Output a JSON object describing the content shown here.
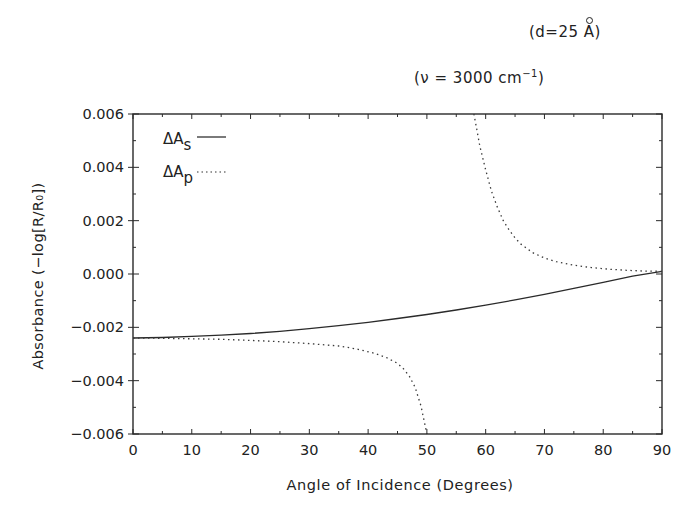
{
  "annotations": {
    "thickness_prefix": "(d=25 ",
    "thickness_unit": "A",
    "thickness_suffix": ")",
    "frequency_prefix": "(ν = 3000 cm",
    "frequency_exp": "−1",
    "frequency_suffix": ")"
  },
  "chart_data": {
    "type": "line",
    "title": "",
    "subtitle": [
      "(d=25 Å)",
      "(ν = 3000 cm⁻¹)"
    ],
    "xlabel": "Angle of Incidence (Degrees)",
    "ylabel": "Absorbance (−log[R/R₀])",
    "xlim": [
      0,
      90
    ],
    "ylim": [
      -0.006,
      0.006
    ],
    "xticks": [
      0,
      10,
      20,
      30,
      40,
      50,
      60,
      70,
      80,
      90
    ],
    "xtick_labels": [
      "0",
      "10",
      "20",
      "30",
      "40",
      "50",
      "60",
      "70",
      "80",
      "90"
    ],
    "yticks": [
      -0.006,
      -0.004,
      -0.002,
      0.0,
      0.002,
      0.004,
      0.006
    ],
    "ytick_labels": [
      "−0.006",
      "−0.004",
      "−0.002",
      "0.000",
      "0.002",
      "0.004",
      "0.006"
    ],
    "grid": false,
    "legend": {
      "position": "upper-left",
      "entries": [
        {
          "label": "ΔA",
          "subscript": "s",
          "style": "solid"
        },
        {
          "label": "ΔA",
          "subscript": "p",
          "style": "dotted"
        }
      ]
    },
    "series": [
      {
        "name": "ΔA_s",
        "style": "solid",
        "segments": [
          {
            "x": [
              0,
              5,
              10,
              15,
              20,
              25,
              30,
              35,
              40,
              45,
              50,
              55,
              60,
              65,
              70,
              75,
              80,
              85,
              90
            ],
            "y": [
              -0.0024,
              -0.00238,
              -0.00234,
              -0.00229,
              -0.00223,
              -0.00215,
              -0.00205,
              -0.00194,
              -0.00181,
              -0.00167,
              -0.00152,
              -0.00135,
              -0.00117,
              -0.00097,
              -0.00076,
              -0.00054,
              -0.00031,
              -8e-05,
              0.0001
            ]
          }
        ]
      },
      {
        "name": "ΔA_p",
        "style": "dotted",
        "segments": [
          {
            "x": [
              0,
              5,
              10,
              15,
              20,
              25,
              30,
              35,
              38,
              41,
              43,
              45,
              46,
              47,
              48,
              49,
              50
            ],
            "y": [
              -0.0024,
              -0.00241,
              -0.00243,
              -0.00245,
              -0.00249,
              -0.00254,
              -0.00261,
              -0.0027,
              -0.00281,
              -0.00297,
              -0.00312,
              -0.00335,
              -0.00355,
              -0.00383,
              -0.00425,
              -0.00495,
              -0.006
            ]
          },
          {
            "x": [
              58,
              58.5,
              59,
              60,
              61,
              62,
              63,
              64,
              65,
              66,
              68,
              70,
              72,
              75,
              78,
              81,
              84,
              87,
              90
            ],
            "y": [
              0.006,
              0.0054,
              0.0048,
              0.0039,
              0.0031,
              0.0025,
              0.002,
              0.00165,
              0.00135,
              0.00112,
              0.0008,
              0.0006,
              0.00046,
              0.00033,
              0.00024,
              0.00018,
              0.00014,
              0.00011,
              0.0001
            ]
          }
        ]
      }
    ]
  }
}
